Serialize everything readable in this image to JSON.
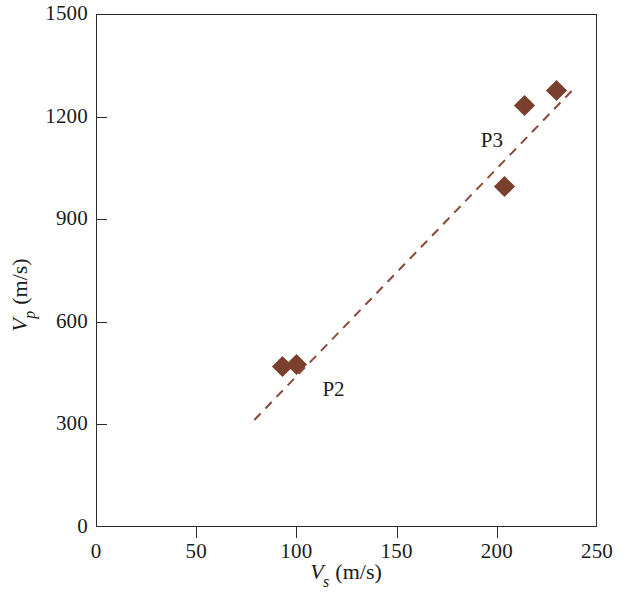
{
  "chart_data": {
    "type": "scatter",
    "title": "",
    "xlabel": "Vs (m/s)",
    "ylabel": "Vp (m/s)",
    "xlabel_parts": {
      "var": "V",
      "sub": "s",
      "unit": " (m/s)"
    },
    "ylabel_parts": {
      "var": "V",
      "sub": "p",
      "unit": " (m/s)"
    },
    "xlim": [
      0,
      250
    ],
    "ylim": [
      0,
      1500
    ],
    "xticks": [
      0,
      50,
      100,
      150,
      200,
      250
    ],
    "yticks": [
      0,
      300,
      600,
      900,
      1200,
      1500
    ],
    "xtick_labels": [
      "0",
      "50",
      "100",
      "150",
      "200",
      "250"
    ],
    "ytick_labels": [
      "0",
      "300",
      "600",
      "900",
      "1200",
      "1500"
    ],
    "grid": false,
    "legend": "none",
    "marker_color": "#7b3f2e",
    "marker_shape": "diamond",
    "trendline": {
      "style": "dashed",
      "color": "#8b4a38",
      "x_start": 79,
      "y_start": 313,
      "x_end": 239,
      "y_end": 1285
    },
    "series": [
      {
        "name": "P2",
        "label": "P2",
        "label_x": 113,
        "label_y": 400,
        "points": [
          {
            "x": 93,
            "y": 468
          },
          {
            "x": 100,
            "y": 474
          }
        ]
      },
      {
        "name": "P3",
        "label": "P3",
        "label_x": 192,
        "label_y": 1130,
        "points": [
          {
            "x": 204,
            "y": 997
          },
          {
            "x": 214,
            "y": 1232
          },
          {
            "x": 230,
            "y": 1276
          }
        ]
      }
    ]
  }
}
